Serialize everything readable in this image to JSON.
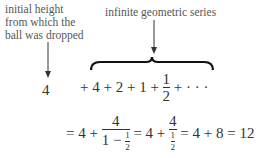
{
  "labels": {
    "initial_height": [
      "initial height",
      "from which the",
      "ball was dropped"
    ],
    "geometric_series": "infinite geometric series"
  },
  "equation": {
    "first_term": "4",
    "series": "+ 4 + 2 + 1 +",
    "half_num": "1",
    "half_den": "2",
    "ellipsis": "+ · · ·",
    "line2_start": "= 4 +",
    "frac1_num": "4",
    "frac1_den_a": "1 −",
    "small_num": "1",
    "small_den": "2",
    "mid": "= 4 +",
    "frac2_num": "4",
    "end": "= 4 + 8 = 12"
  }
}
